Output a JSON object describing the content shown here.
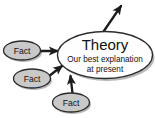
{
  "diagram": {
    "type": "concept-diagram",
    "title_node": {
      "name": "theory-node",
      "heading": "Theory",
      "subtitle_line1": "Our best explanation",
      "subtitle_line2": "at present",
      "shape": "ellipse",
      "fill": "#fefefe",
      "stroke": "#2b2b2b"
    },
    "fact_nodes": [
      {
        "label": "Fact",
        "shape": "ellipse",
        "fill": "#c9c9c9",
        "stroke": "#2b2b2b"
      },
      {
        "label": "Fact",
        "shape": "ellipse",
        "fill": "#c9c9c9",
        "stroke": "#2b2b2b"
      },
      {
        "label": "Fact",
        "shape": "ellipse",
        "fill": "#c9c9c9",
        "stroke": "#2b2b2b"
      }
    ],
    "arrows": [
      {
        "name": "arrow-fact-1-to-theory",
        "direction": "right"
      },
      {
        "name": "arrow-fact-2-to-theory",
        "direction": "up-right"
      },
      {
        "name": "arrow-fact-3-to-theory",
        "direction": "up"
      },
      {
        "name": "arrow-theory-outgoing",
        "direction": "up-right"
      }
    ],
    "colors": {
      "background": "#ffffff",
      "ink": "#2b2b2b",
      "fact_fill": "#c9c9c9",
      "theory_fill": "#fefefe",
      "shadow": "#b4b4b4"
    }
  }
}
